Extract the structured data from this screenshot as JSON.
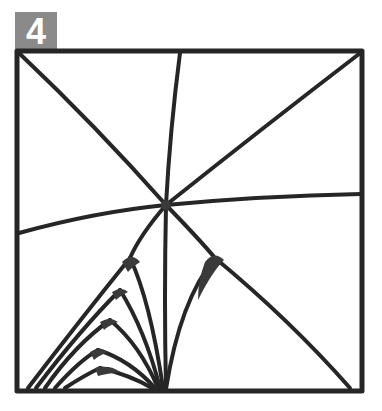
{
  "figure": {
    "panel_label": "4",
    "badge_color": "#8a8a8a",
    "stroke_color": "#262626",
    "fill_color": "#3a3a3a",
    "frame": {
      "x": 17,
      "y": 51,
      "width": 345,
      "height": 340
    },
    "center_node": {
      "x": 166,
      "y": 205
    }
  }
}
